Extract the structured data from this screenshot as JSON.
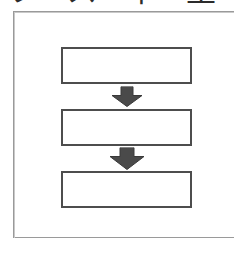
{
  "document": {
    "caption": "フ ス 下 里",
    "caption_note": "cut-off-cjk-heading"
  },
  "colors": {
    "page_background": "#ffffff",
    "frame_border": "#9a9a9a",
    "box_border": "#4d4d4d",
    "box_fill": "#ffffff",
    "arrow_fill": "#4a4a4a",
    "caption_text": "#2b2b2b"
  },
  "diagram": {
    "type": "flowchart",
    "orientation": "vertical",
    "nodes": [
      {
        "id": "box-1",
        "label": "",
        "shape": "rectangle"
      },
      {
        "id": "box-2",
        "label": "",
        "shape": "rectangle"
      },
      {
        "id": "box-3",
        "label": "",
        "shape": "rectangle"
      }
    ],
    "connectors": [
      {
        "id": "arrow-1",
        "from": "box-1",
        "to": "box-2",
        "style": "block-arrow",
        "direction": "down"
      },
      {
        "id": "arrow-2",
        "from": "box-2",
        "to": "box-3",
        "style": "block-arrow",
        "direction": "down"
      }
    ]
  }
}
